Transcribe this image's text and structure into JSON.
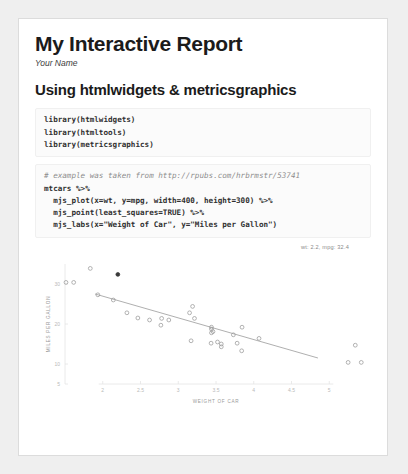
{
  "document": {
    "title": "My Interactive Report",
    "author": "Your Name",
    "section_heading": "Using htmlwidgets & metricsgraphics"
  },
  "code_blocks": [
    {
      "name": "library-code-block",
      "lines": [
        "library(htmlwidgets)",
        "library(htmltools)",
        "library(metricsgraphics)"
      ]
    },
    {
      "name": "plot-code-block",
      "comment": "# example was taken from http://rpubs.com/hrbrmstr/53741",
      "lines": [
        "mtcars %>%",
        "  mjs_plot(x=wt, y=mpg, width=400, height=300) %>%",
        "  mjs_point(least_squares=TRUE) %>%",
        "  mjs_labs(x=\"Weight of Car\", y=\"Miles per Gallon\")"
      ]
    }
  ],
  "chart_data": {
    "type": "scatter",
    "title": "",
    "xlabel": "WEIGHT OF CAR",
    "ylabel": "MILES PER GALLON",
    "xlim": [
      1.5,
      5.5
    ],
    "ylim": [
      5,
      35
    ],
    "xticks": [
      "2",
      "2.5",
      "3",
      "3.5",
      "4",
      "4.5",
      "5"
    ],
    "xtick_values": [
      2,
      2.5,
      3,
      3.5,
      4,
      4.5,
      5
    ],
    "yticks": [
      "30",
      "20",
      "10",
      "5"
    ],
    "ytick_values": [
      30,
      20,
      10,
      5
    ],
    "grid": false,
    "legend": "none",
    "rollover_label": "wt: 2.2, mpg: 32.4",
    "least_squares": true,
    "point_color": "#9a9a9a",
    "active_point_color": "#3a3a3a",
    "line_color": "#9a9a9a",
    "active_point": {
      "x": 2.2,
      "y": 32.4
    },
    "series": [
      {
        "name": "mtcars",
        "x": [
          2.62,
          2.875,
          2.32,
          3.215,
          3.44,
          3.46,
          3.57,
          3.19,
          3.15,
          3.44,
          3.44,
          4.07,
          3.73,
          3.78,
          5.25,
          5.424,
          5.345,
          2.2,
          1.615,
          1.835,
          2.465,
          3.52,
          3.435,
          3.84,
          3.845,
          1.935,
          2.14,
          1.513,
          3.17,
          2.77,
          3.57,
          2.78
        ],
        "y": [
          21.0,
          21.0,
          22.8,
          21.4,
          18.7,
          18.1,
          14.3,
          24.4,
          22.8,
          19.2,
          17.8,
          16.4,
          17.3,
          15.2,
          10.4,
          10.4,
          14.7,
          32.4,
          30.4,
          33.9,
          21.5,
          15.5,
          15.2,
          13.3,
          19.2,
          27.3,
          26.0,
          30.4,
          15.8,
          19.7,
          15.0,
          21.4
        ]
      }
    ],
    "fit_line": {
      "x1": 1.9,
      "y1": 27.5,
      "x2": 4.85,
      "y2": 11.5
    }
  }
}
